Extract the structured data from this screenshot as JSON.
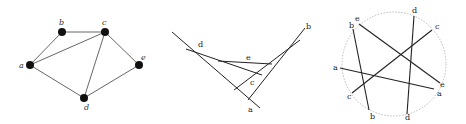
{
  "figure": {
    "panels": [
      {
        "id": "graph",
        "type": "graph",
        "nodes": [
          {
            "id": "a",
            "label": "a",
            "x": 30,
            "y": 65
          },
          {
            "id": "b",
            "label": "b",
            "x": 62,
            "y": 32
          },
          {
            "id": "c",
            "label": "c",
            "x": 105,
            "y": 32
          },
          {
            "id": "d",
            "label": "d",
            "x": 84,
            "y": 98
          },
          {
            "id": "e",
            "label": "e",
            "x": 139,
            "y": 65
          }
        ],
        "edges": [
          [
            "a",
            "b"
          ],
          [
            "b",
            "c"
          ],
          [
            "a",
            "c"
          ],
          [
            "a",
            "d"
          ],
          [
            "c",
            "d"
          ],
          [
            "c",
            "e"
          ],
          [
            "d",
            "e"
          ]
        ]
      },
      {
        "id": "segments",
        "type": "segment-intersection",
        "labels": {
          "a": "a",
          "b": "b",
          "c": "c",
          "d": "d",
          "e": "e"
        }
      },
      {
        "id": "circle",
        "type": "circle-chords",
        "labels": {
          "a": "a",
          "b": "b",
          "c": "c",
          "d": "d",
          "e": "e"
        }
      }
    ]
  }
}
